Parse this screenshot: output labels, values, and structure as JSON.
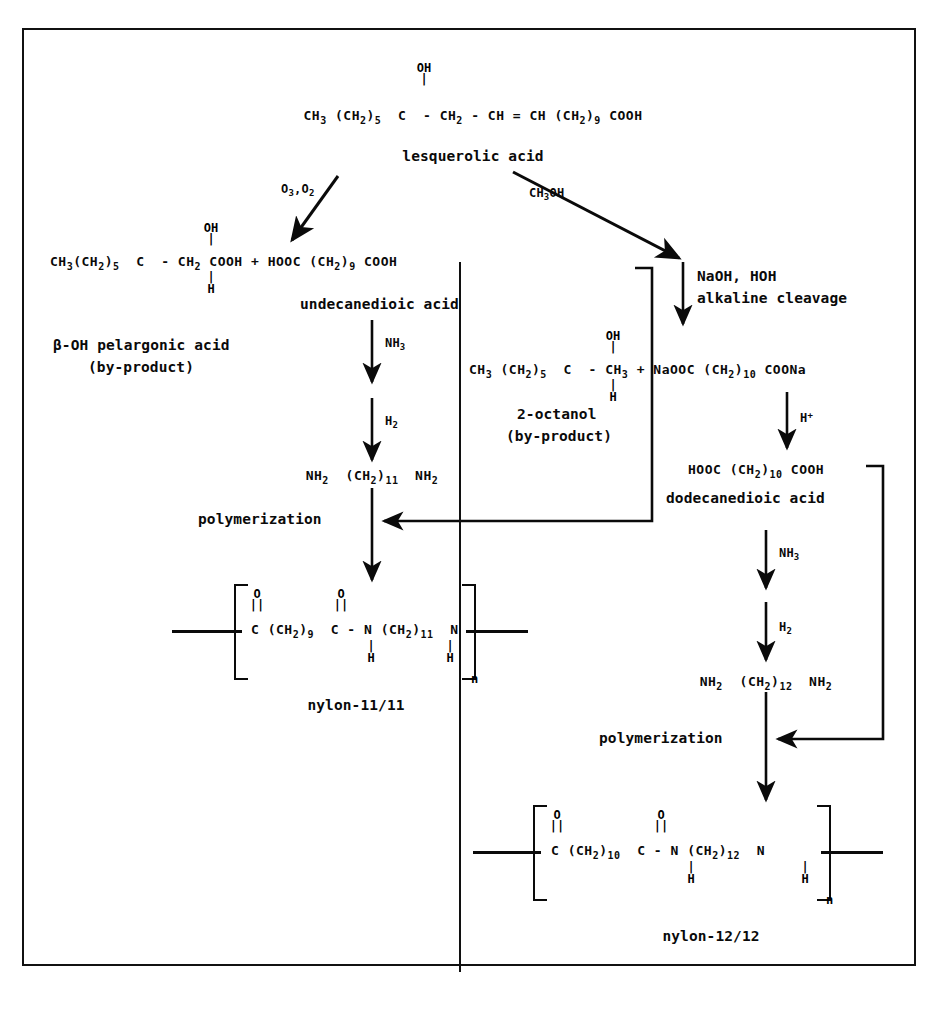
{
  "diagram": {
    "starting_material": {
      "formula_parts": {
        "chain_left": "CH",
        "sub3": "3",
        "group": "(CH",
        "sub2": "2",
        "close5": ")",
        "sub5": "5"
      },
      "formula": "CH3 (CH2)5 C - CH2 - CH = CH (CH2)9 COOH",
      "oh_label": "OH",
      "bond_glyph": "|",
      "name": "lesquerolic acid"
    },
    "left_branch": {
      "condition": "O3,O2",
      "cond_main": "O",
      "cond_sub_a": "3",
      "cond_mid": ",O",
      "cond_sub_b": "2"
    },
    "right_branch": {
      "condition": "CH3OH"
    },
    "left_products": {
      "formula": "CH3(CH2)5 C - CH2 COOH + HOOC (CH2)9 COOH",
      "oh_label": "OH",
      "h_label": "H",
      "byproduct_name": "β-OH pelargonic acid",
      "byproduct_note": "(by-product)",
      "diacid_name": "undecanedioic acid"
    },
    "left_chain": {
      "step1_reagent": "NH3",
      "step2_reagent": "H2",
      "diamine": "NH2 (CH2)11 NH2",
      "polymerization_label": "polymerization",
      "polymer_name": "nylon-11/11",
      "polymer_repeat": "[ C(=O) (CH2)9 C(=O) - N(H) (CH2)11 N(H) ]n",
      "repeat_subscript": "n"
    },
    "right_chain": {
      "cleavage_line1": "NaOH, HOH",
      "cleavage_line2": "alkaline cleavage",
      "products_formula": "CH3 (CH2)5 C - CH3 + NaOOC (CH2)10 COONa",
      "oh_label": "OH",
      "h_label": "H",
      "byproduct_name": "2-octanol",
      "byproduct_note": "(by-product)",
      "acidify_reagent": "H+",
      "diacid_formula": "HOOC (CH2)10 COOH",
      "diacid_name": "dodecanedioic acid",
      "step1_reagent": "NH3",
      "step2_reagent": "H2",
      "diamine": "NH2 (CH2)12 NH2",
      "polymerization_label": "polymerization",
      "polymer_name": "nylon-12/12",
      "polymer_repeat": "[ C(=O) (CH2)10 C(=O) - N(H) (CH2)12 N(H) ]n",
      "repeat_subscript": "n"
    },
    "glyphs": {
      "bond": "|",
      "double_bond": "||",
      "dash": "-",
      "plus": "+",
      "equals": "=",
      "oxygen": "O",
      "hydrogen": "H",
      "nitrogen": "N",
      "carbon": "C"
    },
    "colors": {
      "ink": "#0a0a0a",
      "border": "#111111",
      "background": "#ffffff"
    }
  }
}
